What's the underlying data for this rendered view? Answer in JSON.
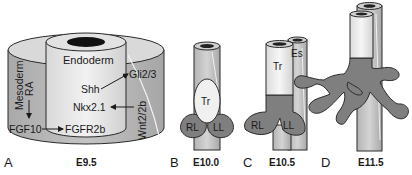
{
  "panels": [
    {
      "letter": "A",
      "stage": "E9.5",
      "labels": {
        "endoderm": "Endoderm",
        "mesoderm": "Mesoderm",
        "ra": "RA",
        "shh": "Shh",
        "gli": "Gli2/3",
        "nkx": "Nkx2.1",
        "wnt": "Wnt2/2b",
        "fgf10": "FGF10",
        "fgfr2b": "FGFR2b"
      }
    },
    {
      "letter": "B",
      "stage": "E10.0",
      "labels": {
        "tr": "Tr",
        "rl": "RL",
        "ll": "LL"
      }
    },
    {
      "letter": "C",
      "stage": "E10.5",
      "labels": {
        "tr": "Tr",
        "es": "Es",
        "rl": "RL",
        "ll": "LL"
      }
    },
    {
      "letter": "D",
      "stage": "E11.5",
      "labels": {}
    }
  ],
  "colors": {
    "mesoderm_fill": "#b9b9b9",
    "cylinder_light": "#e6e6e6",
    "lung_bud": "#7f7f7f",
    "outline": "#2a2a2a"
  }
}
